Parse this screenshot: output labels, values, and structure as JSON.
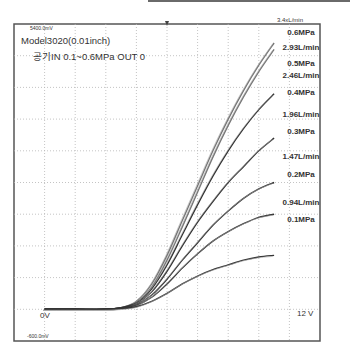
{
  "chart_data": {
    "type": "line",
    "title": "Model3020(0.01inch)",
    "subtitle": "공기IN 0.1~0.6MPa OUT 0",
    "scale_top_label": "5400.0mV",
    "scale_bottom_label": "-600.0mV",
    "zero_label": "0V",
    "ref_label": "12 V",
    "top_cut_label": "3.4xL/min",
    "xlabel": "",
    "ylabel": "",
    "x_divisions": 10,
    "y_divisions": 10,
    "xlim": [
      0,
      10
    ],
    "ylim": [
      -1,
      9
    ],
    "grid": true,
    "legend": "annotations-right",
    "x": [
      0,
      1,
      2,
      3,
      3.5,
      4,
      4.5,
      5,
      5.5,
      6,
      6.5,
      7,
      7.5,
      8,
      8.5
    ],
    "series": [
      {
        "name": "0.6MPa",
        "flow": "",
        "values": [
          0,
          0,
          0,
          0,
          0.05,
          0.25,
          0.8,
          1.7,
          2.8,
          3.9,
          5.0,
          6.0,
          6.9,
          7.7,
          8.4
        ]
      },
      {
        "name": "0.6MPa-b",
        "flow": "",
        "values": [
          0,
          0,
          0,
          0,
          0.05,
          0.22,
          0.7,
          1.55,
          2.6,
          3.7,
          4.8,
          5.8,
          6.7,
          7.5,
          8.2
        ]
      },
      {
        "name": "0.5MPa",
        "flow": "2.93L/min",
        "values": [
          0,
          0,
          0,
          0,
          0.05,
          0.2,
          0.65,
          1.4,
          2.35,
          3.3,
          4.2,
          5.0,
          5.7,
          6.3,
          6.8
        ]
      },
      {
        "name": "0.4MPa",
        "flow": "2.46L/min",
        "values": [
          0,
          0,
          0,
          0,
          0.04,
          0.18,
          0.55,
          1.2,
          2.0,
          2.75,
          3.4,
          4.0,
          4.5,
          5.0,
          5.4
        ]
      },
      {
        "name": "0.3MPa",
        "flow": "1.96L/min",
        "values": [
          0,
          0,
          0,
          0,
          0.04,
          0.15,
          0.45,
          0.95,
          1.55,
          2.1,
          2.65,
          3.1,
          3.5,
          3.8,
          4.0
        ]
      },
      {
        "name": "0.2MPa",
        "flow": "1.47L/min",
        "values": [
          0,
          0,
          0,
          0,
          0.03,
          0.12,
          0.38,
          0.8,
          1.3,
          1.75,
          2.15,
          2.45,
          2.7,
          2.9,
          3.0
        ]
      },
      {
        "name": "0.1MPa",
        "flow": "0.94L/min",
        "values": [
          0,
          0,
          0,
          0,
          0.02,
          0.08,
          0.25,
          0.5,
          0.8,
          1.05,
          1.25,
          1.4,
          1.55,
          1.65,
          1.7
        ]
      }
    ],
    "annotations": [
      {
        "text": "0.6MPa",
        "series": "0.6MPa"
      },
      {
        "text": "2.93L/min",
        "series": "0.5MPa"
      },
      {
        "text": "0.5MPa",
        "series": "0.5MPa"
      },
      {
        "text": "2.46L/min",
        "series": "0.4MPa"
      },
      {
        "text": "0.4MPa",
        "series": "0.4MPa"
      },
      {
        "text": "1.96L/min",
        "series": "0.3MPa"
      },
      {
        "text": "0.3MPa",
        "series": "0.3MPa"
      },
      {
        "text": "1.47L/min",
        "series": "0.2MPa"
      },
      {
        "text": "0.2MPa",
        "series": "0.2MPa"
      },
      {
        "text": "0.94L/min",
        "series": "0.1MPa"
      },
      {
        "text": "0.1MPa",
        "series": "0.1MPa"
      }
    ]
  }
}
